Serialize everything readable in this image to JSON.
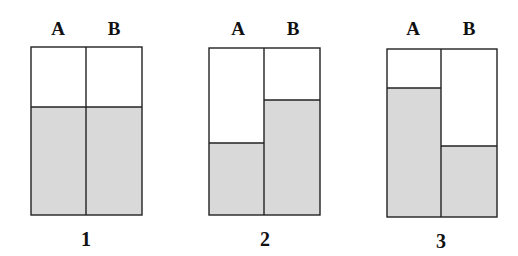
{
  "colors": {
    "fill": "#d9d9d9",
    "stroke": "#222222",
    "background": "#ffffff"
  },
  "diagrams": [
    {
      "number": "1",
      "columns": [
        {
          "label": "A",
          "fill_top_y": 107
        },
        {
          "label": "B",
          "fill_top_y": 107
        }
      ]
    },
    {
      "number": "2",
      "columns": [
        {
          "label": "A",
          "fill_top_y": 143
        },
        {
          "label": "B",
          "fill_top_y": 100
        }
      ]
    },
    {
      "number": "3",
      "columns": [
        {
          "label": "A",
          "fill_top_y": 88
        },
        {
          "label": "B",
          "fill_top_y": 146
        }
      ]
    }
  ]
}
